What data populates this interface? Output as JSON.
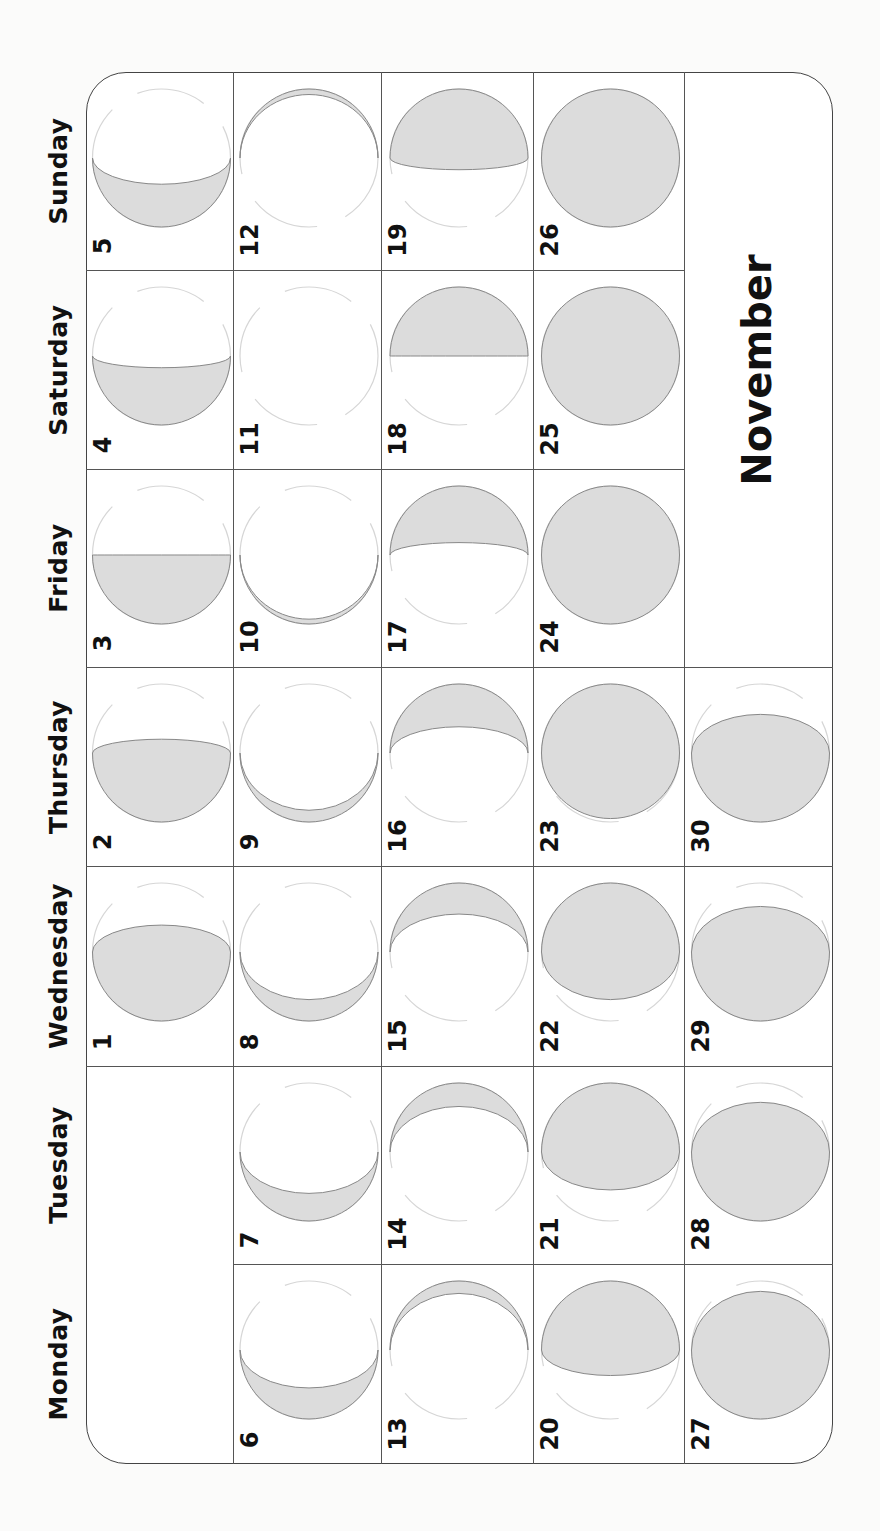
{
  "calendar": {
    "month": "November",
    "weekdays": [
      "Sunday",
      "Saturday",
      "Friday",
      "Thursday",
      "Wednesday",
      "Tuesday",
      "Monday"
    ],
    "colors": {
      "moon_lit": "#dcdcdc",
      "moon_edge": "#888888",
      "moon_outline": "#d6d6d6",
      "grid": "#555555",
      "text": "#111111"
    },
    "grid": {
      "col_edges": [
        86,
        233,
        381,
        533,
        684,
        833
      ],
      "row_edges": [
        72,
        270,
        469,
        667,
        866,
        1066,
        1264,
        1464
      ]
    },
    "days": [
      {
        "day": "5",
        "row": 0,
        "col": 0,
        "lit": "bottom",
        "e": -0.38
      },
      {
        "day": "12",
        "row": 0,
        "col": 1,
        "lit": "top",
        "e": -0.92
      },
      {
        "day": "19",
        "row": 0,
        "col": 2,
        "lit": "top",
        "e": 0.17
      },
      {
        "day": "26",
        "row": 0,
        "col": 3,
        "lit": "top",
        "e": 1
      },
      {
        "day": "4",
        "row": 1,
        "col": 0,
        "lit": "bottom",
        "e": -0.17
      },
      {
        "day": "11",
        "row": 1,
        "col": 1,
        "lit": "bottom",
        "e": -1
      },
      {
        "day": "18",
        "row": 1,
        "col": 2,
        "lit": "top",
        "e": 0
      },
      {
        "day": "25",
        "row": 1,
        "col": 3,
        "lit": "top",
        "e": 1
      },
      {
        "day": "3",
        "row": 2,
        "col": 0,
        "lit": "bottom",
        "e": 0
      },
      {
        "day": "10",
        "row": 2,
        "col": 1,
        "lit": "bottom",
        "e": -0.93
      },
      {
        "day": "17",
        "row": 2,
        "col": 2,
        "lit": "top",
        "e": -0.18
      },
      {
        "day": "24",
        "row": 2,
        "col": 3,
        "lit": "top",
        "e": 1
      },
      {
        "day": "2",
        "row": 3,
        "col": 0,
        "lit": "bottom",
        "e": 0.2
      },
      {
        "day": "9",
        "row": 3,
        "col": 1,
        "lit": "bottom",
        "e": -0.83
      },
      {
        "day": "16",
        "row": 3,
        "col": 2,
        "lit": "top",
        "e": -0.38
      },
      {
        "day": "23",
        "row": 3,
        "col": 3,
        "lit": "top",
        "e": 0.95
      },
      {
        "day": "30",
        "row": 3,
        "col": 4,
        "lit": "bottom",
        "e": 0.56
      },
      {
        "day": "1",
        "row": 4,
        "col": 0,
        "lit": "bottom",
        "e": 0.39
      },
      {
        "day": "8",
        "row": 4,
        "col": 1,
        "lit": "bottom",
        "e": -0.69
      },
      {
        "day": "15",
        "row": 4,
        "col": 2,
        "lit": "top",
        "e": -0.55
      },
      {
        "day": "22",
        "row": 4,
        "col": 3,
        "lit": "top",
        "e": 0.69
      },
      {
        "day": "29",
        "row": 4,
        "col": 4,
        "lit": "bottom",
        "e": 0.66
      },
      {
        "day": "7",
        "row": 5,
        "col": 1,
        "lit": "bottom",
        "e": -0.6
      },
      {
        "day": "14",
        "row": 5,
        "col": 2,
        "lit": "top",
        "e": -0.66
      },
      {
        "day": "21",
        "row": 5,
        "col": 3,
        "lit": "top",
        "e": 0.55
      },
      {
        "day": "28",
        "row": 5,
        "col": 4,
        "lit": "bottom",
        "e": 0.72
      },
      {
        "day": "6",
        "row": 6,
        "col": 1,
        "lit": "bottom",
        "e": -0.55
      },
      {
        "day": "13",
        "row": 6,
        "col": 2,
        "lit": "top",
        "e": -0.82
      },
      {
        "day": "20",
        "row": 6,
        "col": 3,
        "lit": "top",
        "e": 0.37
      },
      {
        "day": "27",
        "row": 6,
        "col": 4,
        "lit": "bottom",
        "e": 0.85
      }
    ]
  }
}
